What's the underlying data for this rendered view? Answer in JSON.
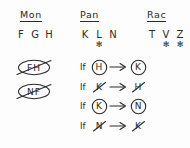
{
  "diagram": {
    "type": "hand-drawn-logic-game-scratchwork",
    "ink_color": "#2b2b2b",
    "background_color": "#fdfdfd",
    "star_glyph": "✻",
    "columns": [
      {
        "id": "mon",
        "header": "Mon",
        "letters": [
          {
            "letter": "F",
            "star": false
          },
          {
            "letter": "G",
            "star": false
          },
          {
            "letter": "H",
            "star": false
          }
        ]
      },
      {
        "id": "pan",
        "header": "Pan",
        "letters": [
          {
            "letter": "K",
            "star": false
          },
          {
            "letter": "L",
            "star": true
          },
          {
            "letter": "N",
            "star": false
          }
        ]
      },
      {
        "id": "rac",
        "header": "Rac",
        "letters": [
          {
            "letter": "T",
            "star": false
          },
          {
            "letter": "V",
            "star": true
          },
          {
            "letter": "Z",
            "star": true
          }
        ]
      }
    ],
    "eliminated": [
      {
        "label": "FH",
        "circled": true,
        "struck": true
      },
      {
        "label": "NF",
        "circled": true,
        "struck": true
      }
    ],
    "rules": [
      {
        "if_label": "If",
        "antecedent": {
          "letter": "H",
          "circled": true,
          "negated": false
        },
        "arrow": "→",
        "consequent": {
          "letter": "K",
          "circled": true,
          "negated": false
        }
      },
      {
        "if_label": "If",
        "antecedent": {
          "letter": "K",
          "circled": false,
          "negated": true
        },
        "arrow": "→",
        "consequent": {
          "letter": "H",
          "circled": false,
          "negated": true
        }
      },
      {
        "if_label": "If",
        "antecedent": {
          "letter": "K",
          "circled": true,
          "negated": false
        },
        "arrow": "→",
        "consequent": {
          "letter": "N",
          "circled": true,
          "negated": false
        }
      },
      {
        "if_label": "If",
        "antecedent": {
          "letter": "N",
          "circled": false,
          "negated": true
        },
        "arrow": "→",
        "consequent": {
          "letter": "K",
          "circled": false,
          "negated": true
        }
      }
    ]
  }
}
